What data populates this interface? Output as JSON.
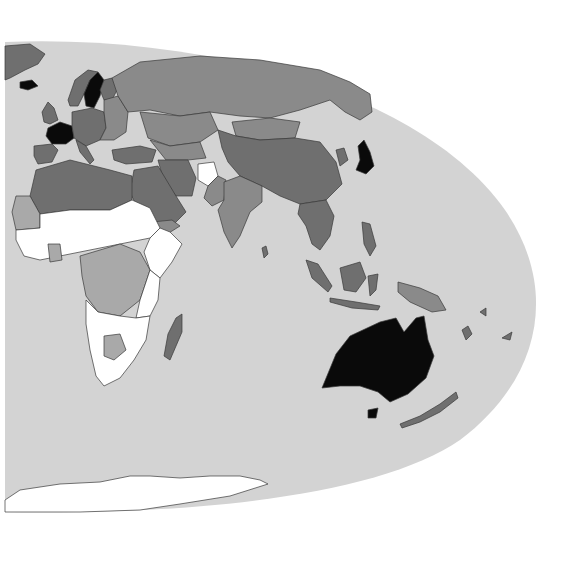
{
  "map": {
    "type": "choropleth",
    "projection": "elliptical (Mollweide-like), eastern hemisphere view",
    "title": "",
    "legend": null,
    "colors": {
      "background": "#ffffff",
      "ocean": "#d3d3d3",
      "border": "#3a3a3a",
      "class_white": "#ffffff",
      "class_light": "#a9a9a9",
      "class_medium": "#8a8a8a",
      "class_dark": "#6f6f6f",
      "class_black": "#0a0a0a"
    },
    "regions": [
      {
        "name": "Greenland",
        "class": "dark"
      },
      {
        "name": "Iceland",
        "class": "black"
      },
      {
        "name": "Sweden",
        "class": "black"
      },
      {
        "name": "Norway",
        "class": "dark"
      },
      {
        "name": "Finland",
        "class": "dark"
      },
      {
        "name": "France",
        "class": "black"
      },
      {
        "name": "United Kingdom",
        "class": "dark"
      },
      {
        "name": "Spain/Portugal",
        "class": "dark"
      },
      {
        "name": "Central Europe",
        "class": "dark"
      },
      {
        "name": "Eastern Europe",
        "class": "medium"
      },
      {
        "name": "Russia",
        "class": "medium"
      },
      {
        "name": "Kazakhstan",
        "class": "medium"
      },
      {
        "name": "Mongolia",
        "class": "medium"
      },
      {
        "name": "China",
        "class": "dark"
      },
      {
        "name": "Japan",
        "class": "black"
      },
      {
        "name": "Afghanistan",
        "class": "white"
      },
      {
        "name": "India",
        "class": "medium"
      },
      {
        "name": "Middle East / Arabia",
        "class": "dark"
      },
      {
        "name": "Iran",
        "class": "dark"
      },
      {
        "name": "North Africa",
        "class": "dark"
      },
      {
        "name": "Western Sahara / Mauritania",
        "class": "light"
      },
      {
        "name": "Sahel / West Africa",
        "class": "white"
      },
      {
        "name": "Central Africa (DRC, Gabon, CAR)",
        "class": "light"
      },
      {
        "name": "Kenya / Uganda",
        "class": "light"
      },
      {
        "name": "Ethiopia / Somalia / Sudan",
        "class": "white"
      },
      {
        "name": "Southern Africa",
        "class": "white"
      },
      {
        "name": "Botswana",
        "class": "light"
      },
      {
        "name": "Madagascar",
        "class": "dark"
      },
      {
        "name": "Southeast Asia",
        "class": "dark"
      },
      {
        "name": "Indonesia",
        "class": "dark"
      },
      {
        "name": "Papua New Guinea",
        "class": "medium"
      },
      {
        "name": "Australia",
        "class": "black"
      },
      {
        "name": "New Zealand",
        "class": "dark"
      },
      {
        "name": "Antarctica",
        "class": "white"
      }
    ]
  }
}
